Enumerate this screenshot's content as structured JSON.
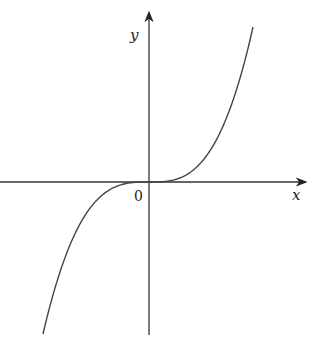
{
  "figure": {
    "x_axis_label": "x",
    "y_axis_label": "y",
    "origin_label": "0",
    "curve_description": "cubic curve y = k*x^3 passing through the origin, increasing, flat at origin"
  },
  "colors": {
    "axis": "#333333",
    "curve": "#444444",
    "background": "#ffffff"
  },
  "layout": {
    "origin_px": [
      149,
      182
    ],
    "x_axis_px_range": [
      0,
      306
    ],
    "y_axis_px_range": [
      12,
      335
    ],
    "curve_endpoints_px": [
      [
        43,
        334
      ],
      [
        253,
        27
      ]
    ]
  }
}
